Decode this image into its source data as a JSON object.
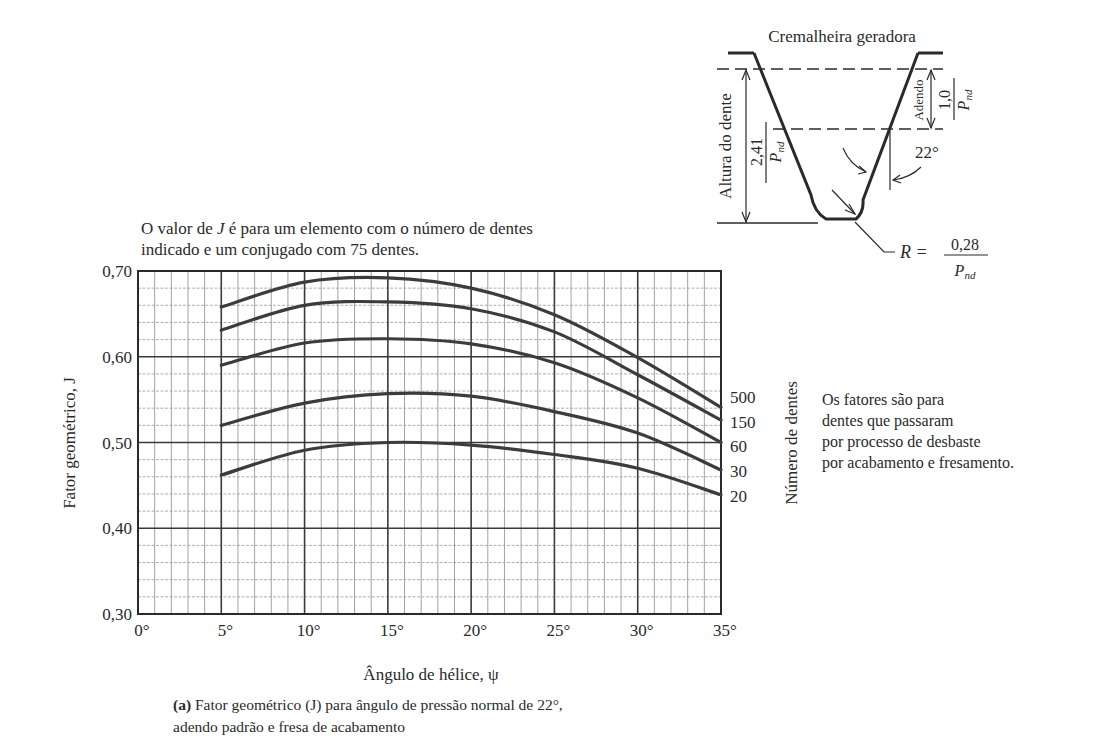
{
  "chart_data": {
    "type": "line",
    "title": "Fator geométrico (J) para ângulo de pressão normal de 22°, adendo padrão e fresa de acabamento",
    "caption_label": "(a)",
    "xlabel": "Ângulo de hélice, ψ",
    "ylabel": "Fator geométrico, J",
    "xlim": [
      0,
      35
    ],
    "ylim": [
      0.3,
      0.7
    ],
    "x_ticks": [
      "0°",
      "5°",
      "10°",
      "15°",
      "20°",
      "25°",
      "30°",
      "35°"
    ],
    "y_ticks": [
      "0,30",
      "0,40",
      "0,50",
      "0,60",
      "0,70"
    ],
    "grid": true,
    "legend_title": "Número de dentes",
    "legend_position": "right",
    "x": [
      5,
      10,
      15,
      20,
      25,
      30,
      35
    ],
    "series": [
      {
        "name": "500",
        "values": [
          0.658,
          0.687,
          0.692,
          0.68,
          0.649,
          0.599,
          0.541
        ]
      },
      {
        "name": "150",
        "values": [
          0.631,
          0.66,
          0.664,
          0.656,
          0.629,
          0.579,
          0.526
        ]
      },
      {
        "name": "60",
        "values": [
          0.59,
          0.616,
          0.621,
          0.615,
          0.593,
          0.552,
          0.5
        ]
      },
      {
        "name": "30",
        "values": [
          0.52,
          0.546,
          0.557,
          0.554,
          0.536,
          0.511,
          0.468
        ]
      },
      {
        "name": "20",
        "values": [
          0.462,
          0.491,
          0.5,
          0.497,
          0.486,
          0.47,
          0.439
        ]
      }
    ],
    "annotations": [
      "O valor de J é para um elemento com o número de dentes indicado e um conjugado com 75 dentes.",
      "Os fatores são para dentes que passaram por processo de desbaste por acabamento e fresamento."
    ]
  },
  "top_note": {
    "line1_pre": "O valor de ",
    "line1_j": "J",
    "line1_post": " é para um elemento com o número de dentes",
    "line2": "indicado e um conjugado com 75 dentes."
  },
  "side_note": {
    "lines": [
      "Os fatores são para",
      "dentes que passaram",
      "por processo de desbaste",
      "por acabamento e fresamento."
    ]
  },
  "caption": {
    "label": "(a)",
    "line1": " Fator geométrico (J) para ângulo de pressão normal de 22°,",
    "line2": "adendo padrão e fresa de acabamento"
  },
  "rack_diagram": {
    "title": "Cremalheira geradora",
    "tooth_height_label": "Altura do dente",
    "tooth_height_num": "2,41",
    "addendum_label": "Adendo",
    "addendum_num": "1,0",
    "denominator": "P",
    "denominator_sub": "nd",
    "angle": "22°",
    "radius_prefix": "R  =",
    "radius_num": "0,28"
  }
}
